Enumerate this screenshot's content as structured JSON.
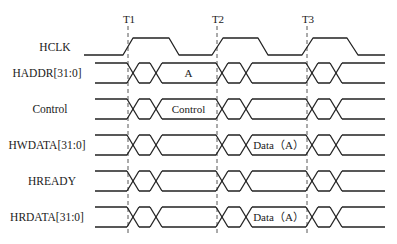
{
  "diagram": {
    "time_markers": [
      {
        "label": "T1",
        "x": 128
      },
      {
        "label": "T2",
        "x": 217
      },
      {
        "label": "T3",
        "x": 307
      }
    ],
    "clock": {
      "name": "HCLK",
      "label_x": 55,
      "label_y": 51,
      "start_x": 84,
      "end_x": 385,
      "low_y": 55,
      "high_y": 38,
      "edges": [
        {
          "rise_start": 123,
          "rise_end": 133,
          "fall_start": 169,
          "fall_end": 179
        },
        {
          "rise_start": 212,
          "rise_end": 223,
          "fall_start": 258,
          "fall_end": 268
        },
        {
          "rise_start": 302,
          "rise_end": 313,
          "fall_start": 347,
          "fall_end": 358
        }
      ]
    },
    "buses": [
      {
        "name": "HADDR[31:0]",
        "label_x": 47,
        "top": 63,
        "segments": [
          {
            "from": 156,
            "to": 217,
            "text": "A"
          }
        ]
      },
      {
        "name": "Control",
        "label_x": 50,
        "top": 99,
        "segments": [
          {
            "from": 156,
            "to": 217,
            "text": "Control"
          }
        ]
      },
      {
        "name": "HWDATA[31:0]",
        "label_x": 47,
        "top": 135,
        "segments": [
          {
            "from": 246,
            "to": 307,
            "text": "Data（A）"
          }
        ]
      },
      {
        "name": "HREADY",
        "label_x": 52,
        "top": 171,
        "segments": []
      },
      {
        "name": "HRDATA[31:0]",
        "label_x": 47,
        "top": 207,
        "segments": [
          {
            "from": 246,
            "to": 307,
            "text": "Data（A）"
          }
        ]
      }
    ],
    "bus_height": 20,
    "bus_start_x": 95,
    "bus_end_x": 385,
    "crossings_per_marker": [
      {
        "x1": 133,
        "x2": 156
      },
      {
        "x1": 222,
        "x2": 246
      },
      {
        "x1": 312,
        "x2": 336
      }
    ],
    "dashed_line_top": 26,
    "dashed_line_bottom": 234,
    "colors": {
      "line": "#222222",
      "text": "#1a1a1a",
      "background": "#ffffff"
    }
  }
}
